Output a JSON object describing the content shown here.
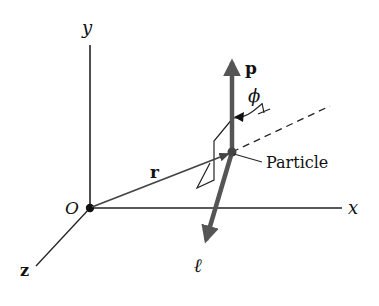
{
  "figure": {
    "axes": {
      "y_label": "y",
      "x_label": "x",
      "z_label": "z",
      "origin_label": "O"
    },
    "vectors": {
      "position_label": "r",
      "momentum_label": "p",
      "angular_momentum_label": "ℓ"
    },
    "angle_label": "ϕ",
    "particle_label": "Particle",
    "colors": {
      "line": "#222222",
      "vector": "#555555",
      "text": "#111111"
    }
  }
}
